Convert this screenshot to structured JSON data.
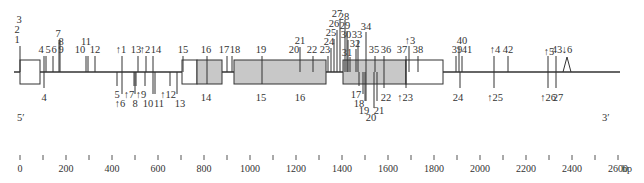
{
  "diagram": {
    "ends": {
      "five_prime": "5′",
      "three_prime": "3′"
    },
    "scale": {
      "unit": "bp",
      "ticks_major": [
        "0",
        "200",
        "400",
        "600",
        "800",
        "1000",
        "1200",
        "1400",
        "1600",
        "1800",
        "2000",
        "2200",
        "2400",
        "2600"
      ],
      "tick_step_bp": 100,
      "max_bp": 2600
    },
    "exons": [
      {
        "id": "exon-1",
        "segments": [
          {
            "x0": 20,
            "x1": 40,
            "fill": "white"
          }
        ]
      },
      {
        "id": "exon-2",
        "segments": [
          {
            "x0": 182,
            "x1": 197,
            "fill": "white"
          },
          {
            "x0": 197,
            "x1": 222,
            "fill": "gray"
          }
        ]
      },
      {
        "id": "exon-3",
        "segments": [
          {
            "x0": 234,
            "x1": 326,
            "fill": "gray"
          }
        ]
      },
      {
        "id": "exon-4",
        "segments": [
          {
            "x0": 343,
            "x1": 406,
            "fill": "gray"
          },
          {
            "x0": 406,
            "x1": 443,
            "fill": "white"
          }
        ]
      }
    ],
    "top_labels": [
      {
        "text": "1",
        "x": 17,
        "y": 43
      },
      {
        "text": "2",
        "x": 17,
        "y": 33
      },
      {
        "text": "3",
        "x": 19,
        "y": 23
      },
      {
        "text": "4",
        "x": 41,
        "y": 53
      },
      {
        "text": "5",
        "x": 48,
        "y": 53
      },
      {
        "text": "6",
        "x": 54,
        "y": 53
      },
      {
        "text": "7",
        "x": 58,
        "y": 37
      },
      {
        "text": "8",
        "x": 61,
        "y": 45
      },
      {
        "text": "9",
        "x": 61,
        "y": 53
      },
      {
        "text": "10",
        "x": 80,
        "y": 53
      },
      {
        "text": "11",
        "x": 86,
        "y": 45
      },
      {
        "text": "12",
        "x": 95,
        "y": 53
      },
      {
        "text": "↑1",
        "x": 121,
        "y": 53
      },
      {
        "text": "13",
        "x": 136,
        "y": 53
      },
      {
        "text": "↑2",
        "x": 145,
        "y": 53
      },
      {
        "text": "14",
        "x": 156,
        "y": 53
      },
      {
        "text": "15",
        "x": 183,
        "y": 53
      },
      {
        "text": "16",
        "x": 206,
        "y": 53
      },
      {
        "text": "17",
        "x": 224,
        "y": 53
      },
      {
        "text": "18",
        "x": 235,
        "y": 53
      },
      {
        "text": "19",
        "x": 261,
        "y": 53
      },
      {
        "text": "20",
        "x": 294,
        "y": 53
      },
      {
        "text": "21",
        "x": 300,
        "y": 44
      },
      {
        "text": "22",
        "x": 312,
        "y": 53
      },
      {
        "text": "23",
        "x": 325,
        "y": 53
      },
      {
        "text": "24",
        "x": 329,
        "y": 45
      },
      {
        "text": "25",
        "x": 331,
        "y": 36
      },
      {
        "text": "26",
        "x": 334,
        "y": 27
      },
      {
        "text": "27",
        "x": 337,
        "y": 17
      },
      {
        "text": "28",
        "x": 344,
        "y": 20
      },
      {
        "text": "29",
        "x": 345,
        "y": 29
      },
      {
        "text": "30",
        "x": 346,
        "y": 38
      },
      {
        "text": "31",
        "x": 347,
        "y": 56
      },
      {
        "text": "32",
        "x": 355,
        "y": 47
      },
      {
        "text": "33",
        "x": 357,
        "y": 38
      },
      {
        "text": "34",
        "x": 366,
        "y": 30
      },
      {
        "text": "35",
        "x": 374,
        "y": 53
      },
      {
        "text": "36",
        "x": 386,
        "y": 53
      },
      {
        "text": "37",
        "x": 402,
        "y": 53
      },
      {
        "text": "↑3",
        "x": 410,
        "y": 44
      },
      {
        "text": "38",
        "x": 418,
        "y": 53
      },
      {
        "text": "39",
        "x": 457,
        "y": 53
      },
      {
        "text": "40",
        "x": 462,
        "y": 44
      },
      {
        "text": "41",
        "x": 467,
        "y": 53
      },
      {
        "text": "↑4",
        "x": 495,
        "y": 53
      },
      {
        "text": "42",
        "x": 508,
        "y": 53
      },
      {
        "text": "↑5",
        "x": 549,
        "y": 55
      },
      {
        "text": "43",
        "x": 557,
        "y": 53
      },
      {
        "text": "↓6",
        "x": 567,
        "y": 53
      }
    ],
    "bottom_labels": [
      {
        "text": "4",
        "x": 44,
        "y": 101
      },
      {
        "text": "5",
        "x": 117,
        "y": 98
      },
      {
        "text": "↑6",
        "x": 120,
        "y": 107
      },
      {
        "text": "↑7",
        "x": 129,
        "y": 98
      },
      {
        "text": "8",
        "x": 135,
        "y": 107
      },
      {
        "text": "↑9",
        "x": 141,
        "y": 98
      },
      {
        "text": "10",
        "x": 148,
        "y": 107
      },
      {
        "text": "11",
        "x": 159,
        "y": 107
      },
      {
        "text": "↑12",
        "x": 168,
        "y": 98
      },
      {
        "text": "13",
        "x": 180,
        "y": 107
      },
      {
        "text": "14",
        "x": 206,
        "y": 101
      },
      {
        "text": "15",
        "x": 261,
        "y": 101
      },
      {
        "text": "16",
        "x": 300,
        "y": 101
      },
      {
        "text": "17",
        "x": 356,
        "y": 98
      },
      {
        "text": "18",
        "x": 359,
        "y": 107
      },
      {
        "text": "19",
        "x": 364,
        "y": 114
      },
      {
        "text": "20",
        "x": 371,
        "y": 121
      },
      {
        "text": "21",
        "x": 379,
        "y": 114
      },
      {
        "text": "22",
        "x": 386,
        "y": 101
      },
      {
        "text": "↑23",
        "x": 405,
        "y": 101
      },
      {
        "text": "24",
        "x": 458,
        "y": 101
      },
      {
        "text": "↑25",
        "x": 495,
        "y": 101
      },
      {
        "text": "↑26",
        "x": 548,
        "y": 101
      },
      {
        "text": "27",
        "x": 558,
        "y": 101
      }
    ],
    "top_lines": [
      {
        "x": 20,
        "y1": 46,
        "y2": 72
      },
      {
        "x": 44,
        "y1": 56,
        "y2": 72
      },
      {
        "x": 46,
        "y1": 56,
        "y2": 72
      },
      {
        "x": 53,
        "y1": 56,
        "y2": 72
      },
      {
        "x": 59,
        "y1": 40,
        "y2": 72
      },
      {
        "x": 60,
        "y1": 40,
        "y2": 72
      },
      {
        "x": 86,
        "y1": 56,
        "y2": 72
      },
      {
        "x": 88,
        "y1": 56,
        "y2": 72
      },
      {
        "x": 95,
        "y1": 56,
        "y2": 72
      },
      {
        "x": 122,
        "y1": 56,
        "y2": 72
      },
      {
        "x": 138,
        "y1": 56,
        "y2": 72
      },
      {
        "x": 146,
        "y1": 56,
        "y2": 72
      },
      {
        "x": 153,
        "y1": 56,
        "y2": 72
      },
      {
        "x": 183,
        "y1": 56,
        "y2": 72
      },
      {
        "x": 207,
        "y1": 56,
        "y2": 84
      },
      {
        "x": 227,
        "y1": 56,
        "y2": 72
      },
      {
        "x": 232,
        "y1": 56,
        "y2": 72
      },
      {
        "x": 262,
        "y1": 56,
        "y2": 84
      },
      {
        "x": 300,
        "y1": 47,
        "y2": 72
      },
      {
        "x": 313,
        "y1": 56,
        "y2": 72
      },
      {
        "x": 328,
        "y1": 56,
        "y2": 72
      },
      {
        "x": 331,
        "y1": 48,
        "y2": 72
      },
      {
        "x": 334,
        "y1": 39,
        "y2": 72
      },
      {
        "x": 337,
        "y1": 30,
        "y2": 72
      },
      {
        "x": 340,
        "y1": 20,
        "y2": 72
      },
      {
        "x": 345,
        "y1": 20,
        "y2": 72
      },
      {
        "x": 347,
        "y1": 31,
        "y2": 72
      },
      {
        "x": 348,
        "y1": 40,
        "y2": 72
      },
      {
        "x": 350,
        "y1": 57,
        "y2": 72
      },
      {
        "x": 356,
        "y1": 49,
        "y2": 72
      },
      {
        "x": 358,
        "y1": 40,
        "y2": 72
      },
      {
        "x": 366,
        "y1": 32,
        "y2": 72
      },
      {
        "x": 375,
        "y1": 56,
        "y2": 72
      },
      {
        "x": 384,
        "y1": 56,
        "y2": 72
      },
      {
        "x": 406,
        "y1": 56,
        "y2": 72
      },
      {
        "x": 409,
        "y1": 46,
        "y2": 72
      },
      {
        "x": 418,
        "y1": 56,
        "y2": 72
      },
      {
        "x": 456,
        "y1": 56,
        "y2": 72
      },
      {
        "x": 459,
        "y1": 47,
        "y2": 72
      },
      {
        "x": 462,
        "y1": 56,
        "y2": 72
      },
      {
        "x": 494,
        "y1": 56,
        "y2": 72
      },
      {
        "x": 508,
        "y1": 56,
        "y2": 72
      },
      {
        "x": 548,
        "y1": 56,
        "y2": 72
      },
      {
        "x": 556,
        "y1": 56,
        "y2": 72
      }
    ],
    "bottom_lines": [
      {
        "x": 44,
        "y1": 72,
        "y2": 88
      },
      {
        "x": 117,
        "y1": 72,
        "y2": 86
      },
      {
        "x": 122,
        "y1": 72,
        "y2": 94
      },
      {
        "x": 134,
        "y1": 72,
        "y2": 86
      },
      {
        "x": 135,
        "y1": 72,
        "y2": 94
      },
      {
        "x": 136,
        "y1": 72,
        "y2": 86
      },
      {
        "x": 145,
        "y1": 72,
        "y2": 86
      },
      {
        "x": 153,
        "y1": 72,
        "y2": 94
      },
      {
        "x": 155,
        "y1": 72,
        "y2": 94
      },
      {
        "x": 170,
        "y1": 72,
        "y2": 86
      },
      {
        "x": 177,
        "y1": 72,
        "y2": 94
      },
      {
        "x": 359,
        "y1": 72,
        "y2": 86
      },
      {
        "x": 363,
        "y1": 72,
        "y2": 94
      },
      {
        "x": 365,
        "y1": 72,
        "y2": 101
      },
      {
        "x": 366,
        "y1": 72,
        "y2": 101
      },
      {
        "x": 374,
        "y1": 72,
        "y2": 108
      },
      {
        "x": 377,
        "y1": 72,
        "y2": 101
      },
      {
        "x": 384,
        "y1": 72,
        "y2": 88
      },
      {
        "x": 406,
        "y1": 72,
        "y2": 88
      },
      {
        "x": 460,
        "y1": 72,
        "y2": 88
      },
      {
        "x": 494,
        "y1": 72,
        "y2": 88
      },
      {
        "x": 548,
        "y1": 72,
        "y2": 88
      },
      {
        "x": 556,
        "y1": 72,
        "y2": 88
      }
    ],
    "colors": {
      "line": "#333333",
      "exon_gray": "#c8c8c8",
      "exon_white": "#ffffff",
      "text": "#333333"
    }
  }
}
